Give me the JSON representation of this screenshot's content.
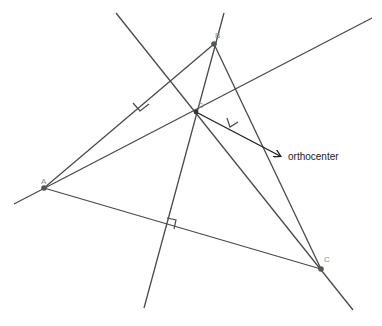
{
  "diagram": {
    "title": "",
    "points": [
      {
        "id": "A",
        "label": "A",
        "x": 44,
        "y": 188,
        "lx": 41,
        "ly": 184
      },
      {
        "id": "B",
        "label": "B",
        "x": 214,
        "y": 44,
        "lx": 215,
        "ly": 38
      },
      {
        "id": "C",
        "label": "C",
        "x": 321,
        "y": 269,
        "lx": 324,
        "ly": 262
      },
      {
        "id": "D",
        "label": "D",
        "x": 196,
        "y": 112,
        "lx": 198,
        "ly": 108
      }
    ],
    "annotation": {
      "text": "orthocenter",
      "x": 288,
      "y": 160,
      "arrow_from": [
        196,
        112
      ],
      "arrow_to": [
        281,
        156
      ]
    },
    "colors": {
      "line": "#4a4a4a",
      "point": "#555555",
      "label": "#8a8a8a",
      "arrow": "#222222"
    }
  }
}
